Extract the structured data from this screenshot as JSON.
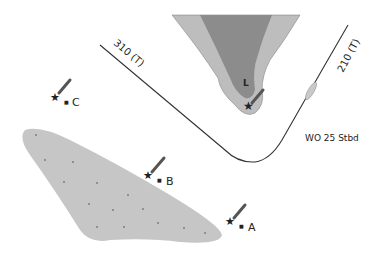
{
  "diagram": {
    "course_labels": {
      "first_leg": "310 (T)",
      "second_leg": "210 (T)"
    },
    "wheel_over": "WO 25 Stbd",
    "marks": [
      {
        "id": "L",
        "label": "L"
      },
      {
        "id": "C",
        "label": "C"
      },
      {
        "id": "B",
        "label": "B"
      },
      {
        "id": "A",
        "label": "A"
      }
    ],
    "colors": {
      "land_dark": "#8c8c8c",
      "land_light": "#bdbdbd",
      "shoal": "#c6c6c6",
      "line": "#333333",
      "light_flare": "#6a6a6a"
    }
  }
}
